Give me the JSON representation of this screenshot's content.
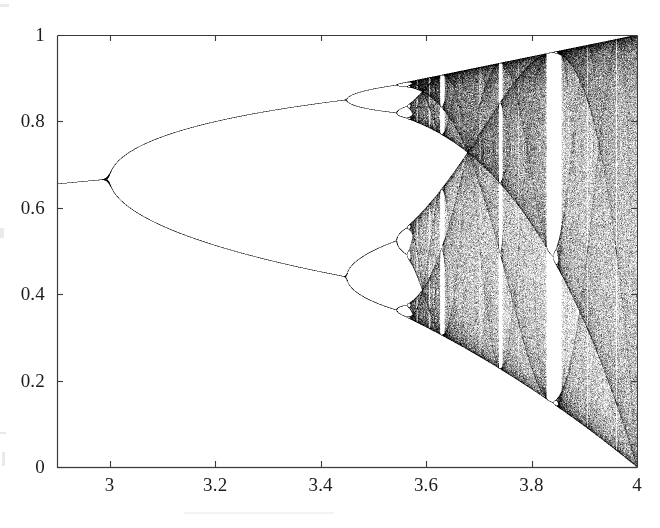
{
  "figure": {
    "name": "logistic-map-bifurcation-diagram",
    "background_color": "#ffffff",
    "ink_color": "#1d1d1d",
    "axis_color": "#3a3a3a"
  },
  "chart_data": {
    "type": "scatter",
    "title": "",
    "subtitle": "",
    "xlabel": "",
    "ylabel": "",
    "equation": "x_{n+1} = r x_n (1 - x_n)",
    "xlim": [
      2.9,
      4.0
    ],
    "ylim": [
      0.0,
      1.0
    ],
    "grid": false,
    "legend": null,
    "x_ticks": [
      3,
      3.2,
      3.4,
      3.6,
      3.8,
      4
    ],
    "x_tick_labels": [
      "3",
      "3.2",
      "3.4",
      "3.6",
      "3.8",
      "4"
    ],
    "y_ticks": [
      0,
      0.2,
      0.4,
      0.6,
      0.8,
      1
    ],
    "y_tick_labels": [
      "0",
      "0.2",
      "0.4",
      "0.6",
      "0.8",
      "1"
    ],
    "tick_direction": "in",
    "point_color": "#000000",
    "point_size": 1,
    "r_samples": 1500,
    "iterations_transient": 300,
    "iterations_plotted": 260,
    "annotations": [],
    "features": [
      {
        "label": "period-1 fixed point",
        "r_range": [
          2.9,
          3.0
        ],
        "x_values": [
          0.655
        ]
      },
      {
        "label": "first period-doubling",
        "r": 3.0,
        "x": 0.6667
      },
      {
        "label": "second period-doubling",
        "r": 3.449,
        "x_values": [
          0.44,
          0.85
        ]
      },
      {
        "label": "third period-doubling",
        "r": 3.544,
        "x_values": [
          0.37,
          0.52,
          0.82,
          0.88
        ]
      },
      {
        "label": "accumulation point (onset of chaos)",
        "r": 3.5699
      },
      {
        "label": "period-3 window",
        "r_range": [
          3.828,
          3.857
        ]
      },
      {
        "label": "period-5 window",
        "r_range": [
          3.738,
          3.745
        ]
      },
      {
        "label": "period-6 window",
        "r_range": [
          3.626,
          3.635
        ]
      },
      {
        "label": "full chaos",
        "r": 4.0,
        "x_range": [
          0.0,
          1.0
        ]
      }
    ]
  },
  "plot_box": {
    "left_px": 57,
    "top_px": 35,
    "right_px": 637,
    "bottom_px": 467
  },
  "y_axis": {
    "labels": [
      {
        "text": "1",
        "value": 1.0
      },
      {
        "text": "0.8",
        "value": 0.8
      },
      {
        "text": "0.6",
        "value": 0.6
      },
      {
        "text": "0.4",
        "value": 0.4
      },
      {
        "text": "0.2",
        "value": 0.2
      },
      {
        "text": "0",
        "value": 0.0
      }
    ]
  },
  "x_axis": {
    "labels": [
      {
        "text": "3",
        "value": 3.0
      },
      {
        "text": "3.2",
        "value": 3.2
      },
      {
        "text": "3.4",
        "value": 3.4
      },
      {
        "text": "3.6",
        "value": 3.6
      },
      {
        "text": "3.8",
        "value": 3.8
      },
      {
        "text": "4",
        "value": 4.0
      }
    ]
  }
}
